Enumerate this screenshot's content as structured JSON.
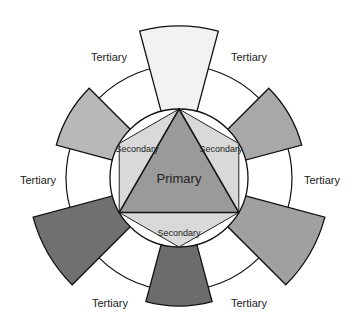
{
  "diagram": {
    "center": {
      "x": 179,
      "y": 178
    },
    "inner_radius": 69,
    "ring_radius": 113,
    "primary": {
      "label": "Primary",
      "color": "#9a9a9a"
    },
    "secondary": {
      "label": "Secondary",
      "color": "#d9d9d9",
      "labels": [
        "Secondary",
        "Secondary",
        "Secondary"
      ]
    },
    "tertiary": {
      "label": "Tertiary",
      "labels": [
        "Tertiary",
        "Tertiary",
        "Tertiary",
        "Tertiary",
        "Tertiary",
        "Tertiary"
      ],
      "segments": [
        {
          "position": "top",
          "color": "#f2f2f2"
        },
        {
          "position": "upper-right",
          "color": "#a8a8a8"
        },
        {
          "position": "lower-right",
          "color": "#a0a0a0"
        },
        {
          "position": "bottom",
          "color": "#6c6c6c"
        },
        {
          "position": "lower-left",
          "color": "#707070"
        },
        {
          "position": "upper-left",
          "color": "#b8b8b8"
        }
      ]
    }
  }
}
